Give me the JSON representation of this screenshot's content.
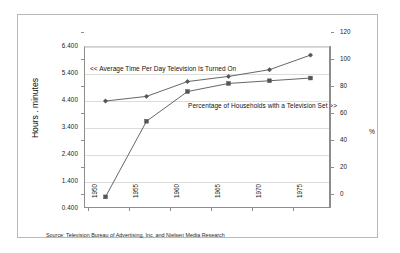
{
  "chart_data": {
    "type": "line",
    "title": "",
    "xlabel": "",
    "ylabel": "Hours . minutes",
    "ylabel_right": "%",
    "x": [
      1950,
      1955,
      1960,
      1965,
      1970,
      1975
    ],
    "categories": [
      "1950",
      "1955",
      "1960",
      "1965",
      "1970",
      "1975"
    ],
    "ylim": [
      0.4,
      6.4
    ],
    "ylim_right": [
      0,
      120
    ],
    "yticks": [
      "0.400",
      "1.400",
      "2.400",
      "3.400",
      "4.400",
      "5.400",
      "6.400"
    ],
    "ytick_values": [
      0.4,
      1.4,
      2.4,
      3.4,
      4.4,
      5.4,
      6.4
    ],
    "yticks_right": [
      "0",
      "20",
      "40",
      "60",
      "80",
      "100",
      "120"
    ],
    "ytick_values_right": [
      0,
      20,
      40,
      60,
      80,
      100,
      120
    ],
    "grid": true,
    "legend": "annotations",
    "series": [
      {
        "name": "Average Time Per Day Television Is Turned On",
        "axis": "left",
        "marker": "diamond",
        "color": "#555555",
        "values": [
          4.4,
          4.57,
          5.12,
          5.31,
          5.56,
          6.1
        ]
      },
      {
        "name": "Percentage of Households with a Television Set",
        "axis": "right",
        "marker": "square",
        "color": "#555555",
        "values": [
          9,
          65,
          87,
          93,
          95,
          97
        ]
      }
    ],
    "annotations": [
      {
        "text": "<< Average Time Per Day Television Is Turned On"
      },
      {
        "text": "Percentage of Households with a Television Set >>"
      }
    ],
    "source": "Source: Television Bureau of Advertising, Inc. and Nielsen Media Research"
  },
  "colors": {
    "line": "#555555",
    "grid": "#dcdcdc",
    "axis": "#8d8d8d",
    "frame": "#b9b9b9",
    "text": "#1a1a1a",
    "background": "#ffffff"
  }
}
